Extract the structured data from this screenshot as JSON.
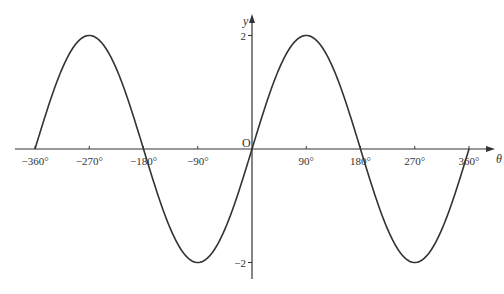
{
  "chart_data": {
    "type": "line",
    "title": "",
    "function": "y = 2 sin θ",
    "xlabel": "θ",
    "ylabel": "y",
    "origin_label": "O",
    "xlim": [
      -360,
      360
    ],
    "ylim": [
      -2,
      2
    ],
    "grid": false,
    "legend": null,
    "x_ticks": [
      -360,
      -270,
      -180,
      -90,
      90,
      180,
      270,
      360
    ],
    "x_tick_labels": [
      "−360°",
      "−270°",
      "−180°",
      "−90°",
      "90°",
      "180°",
      "270°",
      "360°"
    ],
    "y_ticks": [
      2,
      -2
    ],
    "y_tick_labels": [
      "2",
      "−2"
    ],
    "series": [
      {
        "name": "2 sin θ",
        "x": [
          -360,
          -315,
          -270,
          -225,
          -180,
          -135,
          -90,
          -45,
          0,
          45,
          90,
          135,
          180,
          225,
          270,
          315,
          360
        ],
        "values": [
          0,
          1.41,
          2,
          1.41,
          0,
          -1.41,
          -2,
          -1.41,
          0,
          1.41,
          2,
          1.41,
          0,
          -1.41,
          -2,
          -1.41,
          0
        ]
      }
    ],
    "amplitude": 2,
    "period_degrees": 360,
    "line_color": "#333333"
  }
}
